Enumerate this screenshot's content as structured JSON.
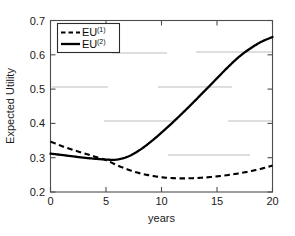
{
  "chart_data": {
    "type": "line",
    "title": "",
    "xlabel": "years",
    "ylabel": "Expected Utility",
    "xlim": [
      0,
      20
    ],
    "ylim": [
      0.2,
      0.7
    ],
    "xticks": [
      0,
      5,
      10,
      15,
      20
    ],
    "xticklabels": [
      "0",
      "5",
      "10",
      "15",
      "20"
    ],
    "yticks": [
      0.2,
      0.3,
      0.4,
      0.5,
      0.6,
      0.7
    ],
    "yticklabels": [
      "0.2",
      "0.3",
      "0.4",
      "0.5",
      "0.6",
      "0.7"
    ],
    "grid": false,
    "legend_position": "upper left",
    "series": [
      {
        "name": "EU",
        "superscript": "(1)",
        "label": "EU(1)",
        "style": "dashed",
        "color": "#000000",
        "x": [
          0,
          1,
          2,
          3,
          4,
          5,
          6,
          7,
          8,
          9,
          10,
          11,
          12,
          13,
          14,
          15,
          16,
          17,
          18,
          19,
          20
        ],
        "values": [
          0.347,
          0.334,
          0.323,
          0.313,
          0.303,
          0.293,
          0.278,
          0.265,
          0.255,
          0.248,
          0.243,
          0.2405,
          0.2397,
          0.2405,
          0.2425,
          0.2455,
          0.2495,
          0.2545,
          0.2605,
          0.268,
          0.277
        ]
      },
      {
        "name": "EU",
        "superscript": "(2)",
        "label": "EU(2)",
        "style": "solid",
        "color": "#000000",
        "x": [
          0,
          1,
          2,
          3,
          4,
          5,
          6,
          7,
          8,
          9,
          10,
          11,
          12,
          13,
          14,
          15,
          16,
          17,
          18,
          19,
          20
        ],
        "values": [
          0.312,
          0.308,
          0.304,
          0.3,
          0.297,
          0.2945,
          0.2945,
          0.3035,
          0.3215,
          0.3455,
          0.373,
          0.4025,
          0.4335,
          0.4655,
          0.4985,
          0.5315,
          0.5645,
          0.5945,
          0.6185,
          0.638,
          0.652
        ]
      }
    ],
    "legend": [
      {
        "label": "EU",
        "superscript": "(1)",
        "style": "dashed"
      },
      {
        "label": "EU",
        "superscript": "(2)",
        "style": "solid"
      }
    ]
  },
  "colors": {
    "axis": "#4d4d4d",
    "line": "#000000",
    "text": "#1a1a1a",
    "artifact_gridline": "#b8b8b8",
    "background": "#ffffff"
  }
}
